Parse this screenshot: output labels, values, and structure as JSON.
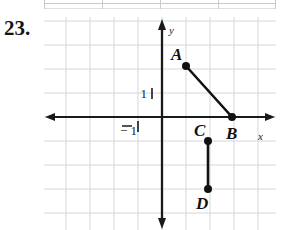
{
  "exercise": {
    "number": "23."
  },
  "graph": {
    "axes": {
      "x_label": "x",
      "y_label": "y",
      "x_tick_label": "− 1",
      "y_tick_label": "1"
    },
    "colors": {
      "grid": "#d6d6dc",
      "axis": "#1a1a1a",
      "segment": "#111111",
      "point": "#111111",
      "background": "#ffffff"
    },
    "geometry": {
      "grid_spacing": 24,
      "origin_x": 118,
      "origin_y": 100,
      "x_axis_y": 100,
      "y_axis_x": 118
    },
    "points": [
      {
        "label": "A",
        "px": 142,
        "py": 49,
        "label_px": 127,
        "label_py": 43
      },
      {
        "label": "B",
        "px": 188,
        "py": 100,
        "label_px": 182,
        "label_py": 122
      },
      {
        "label": "C",
        "px": 164,
        "py": 124,
        "label_px": 150,
        "label_py": 119
      },
      {
        "label": "D",
        "px": 164,
        "py": 172,
        "label_px": 152,
        "label_py": 192
      }
    ],
    "segments": [
      {
        "name": "segment-AB",
        "from": "A",
        "to": "B",
        "x1": 142,
        "y1": 49,
        "x2": 188,
        "y2": 100
      },
      {
        "name": "segment-CD",
        "from": "C",
        "to": "D",
        "x1": 164,
        "y1": 124,
        "x2": 164,
        "y2": 172
      }
    ]
  },
  "chart_data": {
    "type": "scatter",
    "title": "",
    "xlabel": "x",
    "ylabel": "y",
    "grid": true,
    "legend": null,
    "xlim": [
      -3,
      6.5
    ],
    "ylim": [
      -5.5,
      3.5
    ],
    "xticks": [
      -1
    ],
    "yticks": [
      1
    ],
    "points": [
      {
        "name": "A",
        "x": 1,
        "y": 2
      },
      {
        "name": "B",
        "x": 3,
        "y": 0
      },
      {
        "name": "C",
        "x": 2,
        "y": -1
      },
      {
        "name": "D",
        "x": 2,
        "y": -3
      }
    ],
    "segments": [
      {
        "from": "A",
        "to": "B"
      },
      {
        "from": "C",
        "to": "D"
      }
    ],
    "annotations": [
      "1",
      "− 1"
    ]
  }
}
